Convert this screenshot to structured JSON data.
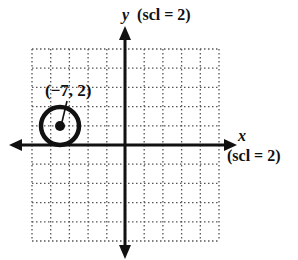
{
  "diagram": {
    "type": "coordinate-plane-circle",
    "y_axis_label": {
      "var": "y",
      "scale": "(scl = 2)"
    },
    "x_axis_label": {
      "var": "x",
      "scale": "(scl = 2)"
    },
    "point_label": "(−7, 2)",
    "circle": {
      "center": [
        -7,
        2
      ],
      "radius": 2
    },
    "grid": {
      "xmin": -10,
      "xmax": 10,
      "ymin": -10,
      "ymax": 10,
      "step": 2
    },
    "colors": {
      "ink": "#111111",
      "grid": "#555555",
      "background": "#ffffff"
    }
  }
}
